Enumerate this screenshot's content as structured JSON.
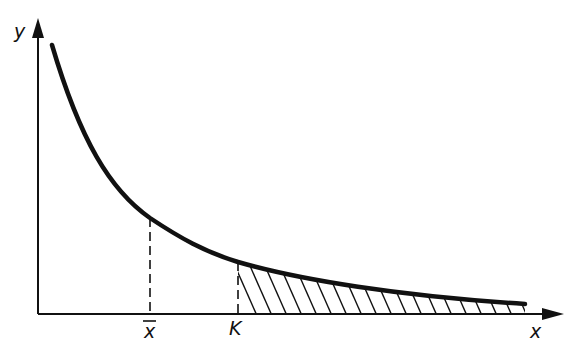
{
  "diagram": {
    "title": "",
    "axes": {
      "x_label": "x",
      "y_label": "y"
    },
    "markers": {
      "mean_label": "x̄",
      "threshold_label": "K"
    },
    "curve": {
      "description": "Decreasing convex density curve (heavy-tailed) from top-left toward the x-axis",
      "shaded_region": "Hatched tail area under the curve to the right of K"
    },
    "colors": {
      "ink": "#111111",
      "background": "#ffffff"
    }
  }
}
